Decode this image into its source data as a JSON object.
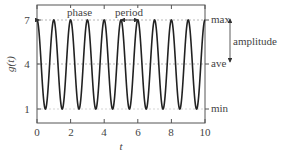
{
  "chart_data": {
    "type": "line",
    "title": "",
    "xlabel": "t",
    "ylabel": "g(t)",
    "xlim": [
      0,
      10
    ],
    "ylim": [
      0.2,
      7.8
    ],
    "x_ticks": [
      0,
      2,
      4,
      6,
      8,
      10
    ],
    "y_ticks": [
      1,
      4,
      7
    ],
    "function": "g(t) = 4 + 3cos(2πt)",
    "series": [
      {
        "name": "g(t)",
        "x": [
          0,
          0.5,
          1,
          1.5,
          2,
          2.5,
          3,
          3.5,
          4,
          4.5,
          5,
          5.5,
          6,
          6.5,
          7,
          7.5,
          8,
          8.5,
          9,
          9.5,
          10
        ],
        "values": [
          7,
          1,
          7,
          1,
          7,
          1,
          7,
          1,
          7,
          1,
          7,
          1,
          7,
          1,
          7,
          1,
          7,
          1,
          7,
          1,
          7
        ],
        "color": "#222222"
      }
    ],
    "reference_lines": [
      {
        "y": 7,
        "label": "max",
        "style": "dashed"
      },
      {
        "y": 4,
        "label": "ave",
        "style": "dashed"
      },
      {
        "y": 1,
        "label": "min",
        "style": "dashed"
      }
    ],
    "annotations": [
      {
        "text": "phase",
        "type": "double-arrow",
        "x_from": 0,
        "x_to": 4,
        "y": 7
      },
      {
        "text": "period",
        "type": "double-arrow",
        "x_from": 5,
        "x_to": 6,
        "y": 7
      },
      {
        "text": "amplitude",
        "type": "double-arrow",
        "y_from": 7,
        "y_to": 4
      }
    ],
    "grid": false,
    "legend": "none"
  },
  "labels": {
    "xlabel": "t",
    "ylabel": "g(t)",
    "x_ticks": [
      "0",
      "2",
      "4",
      "6",
      "8",
      "10"
    ],
    "y_ticks": [
      "7",
      "4",
      "1"
    ],
    "max": "max",
    "ave": "ave",
    "min": "min",
    "amplitude": "amplitude",
    "phase": "phase",
    "period": "period"
  }
}
